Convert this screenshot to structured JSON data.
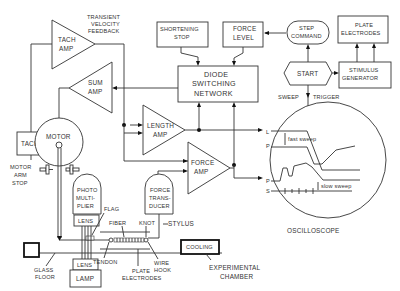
{
  "diagram": {
    "type": "block-diagram"
  },
  "blocks": {
    "tach_amp": {
      "line1": "TACH",
      "line2": "AMP"
    },
    "transient_feedback": {
      "line1": "TRANSIENT",
      "line2": "VELOCITY",
      "line3": "FEEDBACK"
    },
    "sum_amp": {
      "line1": "SUM",
      "line2": "AMP"
    },
    "shortening_stop": {
      "line1": "SHORTENING",
      "line2": "STOP"
    },
    "force_level": {
      "line1": "FORCE",
      "line2": "LEVEL"
    },
    "step_command": {
      "line1": "STEP",
      "line2": "COMMAND"
    },
    "plate_electrodes_top": {
      "line1": "PLATE",
      "line2": "ELECTRODES"
    },
    "diode_switching": {
      "line1": "DIODE",
      "line2": "SWITCHING",
      "line3": "NETWORK"
    },
    "start": {
      "label": "START"
    },
    "stimulus_generator": {
      "line1": "STIMULUS",
      "line2": "GENERATOR"
    },
    "sweep_trigger": {
      "left": "SWEEP",
      "right": "TRIGGER"
    },
    "length_amp": {
      "line1": "LENGTH",
      "line2": "AMP"
    },
    "force_amp": {
      "line1": "FORCE",
      "line2": "AMP"
    },
    "tach": {
      "label": "TACH"
    },
    "motor": {
      "label": "MOTOR"
    },
    "motor_arm_stop": {
      "line1": "MOTOR",
      "line2": "ARM",
      "line3": "STOP"
    },
    "photomultiplier": {
      "line1": "PHOTO",
      "line2": "MULTI-",
      "line3": "PLIER"
    },
    "force_transducer": {
      "line1": "FORCE",
      "line2": "TRANS-",
      "line3": "DUCER"
    },
    "lens_top": {
      "label": "LENS"
    },
    "lens_bottom": {
      "label": "LENS"
    },
    "lamp": {
      "label": "LAMP"
    },
    "cooling": {
      "label": "COOLING"
    },
    "oscilloscope": {
      "label": "OSCILLOSCOPE"
    }
  },
  "annotations": {
    "flag": "FLAG",
    "fiber": "FIBER",
    "knot": "KNOT",
    "stylus": "STYLUS",
    "tendon": "TENDON",
    "wire_hook": {
      "line1": "WIRE",
      "line2": "HOOK"
    },
    "plate_electrodes_bottom": {
      "line1": "PLATE",
      "line2": "ELECTRODES"
    },
    "glass_floor": {
      "line1": "GLASS",
      "line2": "FLOOR"
    },
    "experimental_chamber": {
      "line1": "EXPERIMENTAL",
      "line2": "CHAMBER"
    }
  },
  "oscilloscope_traces": {
    "labels": [
      "L",
      "P",
      "P",
      "S"
    ],
    "fast_sweep": "fast sweep",
    "slow_sweep": "slow sweep"
  }
}
